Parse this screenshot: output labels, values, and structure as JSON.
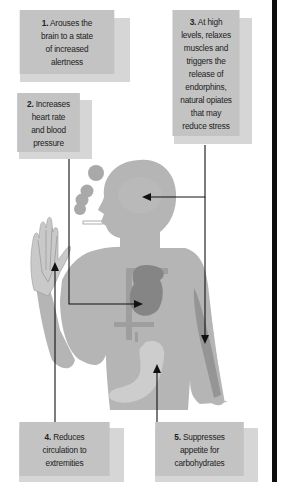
{
  "diagram": {
    "type": "annotated-illustration",
    "colors": {
      "box_face": "#c3c3c3",
      "box_shadow": "#d6d6d6",
      "body": "#b5b5b5",
      "organ_dark": "#8a8a8a",
      "stomach": "#cdcdcd",
      "smoke": "#a9a9a9",
      "arrow": "#111111",
      "divider": "#0e0e0e"
    },
    "callouts": [
      {
        "num": "1.",
        "lines": [
          "Arouses the",
          "brain to a state",
          "of increased",
          "alertness"
        ]
      },
      {
        "num": "2.",
        "lines": [
          "Increases",
          "heart rate",
          "and blood",
          "pressure"
        ]
      },
      {
        "num": "3.",
        "lines": [
          "At high",
          "levels, relaxes",
          "muscles and",
          "triggers the",
          "release of",
          "endorphins,",
          "natural opiates",
          "that may",
          "reduce stress"
        ]
      },
      {
        "num": "4.",
        "lines": [
          "Reduces",
          "circulation to",
          "extremities"
        ]
      },
      {
        "num": "5.",
        "lines": [
          "Suppresses",
          "appetite for",
          "carbohydrates"
        ]
      }
    ],
    "arrows": [
      {
        "from": "callout-2",
        "to": "heart"
      },
      {
        "from": "callout-3",
        "to": "brain"
      },
      {
        "from": "callout-3",
        "to": "arm-muscle"
      },
      {
        "from": "callout-4",
        "to": "hand"
      },
      {
        "from": "callout-5",
        "to": "stomach"
      }
    ]
  }
}
